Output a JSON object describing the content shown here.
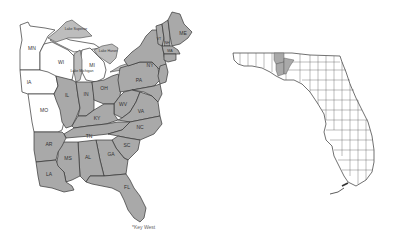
{
  "figure": {
    "type": "species distribution map",
    "shade_color": "#a9a9a9",
    "unshaded_color": "#ffffff",
    "outline_color": "#333333"
  },
  "us_map": {
    "states_present": [
      "ME",
      "NH",
      "VT",
      "MA",
      "RI",
      "CT",
      "NY",
      "NJ",
      "PA",
      "DE",
      "MD",
      "VA",
      "WV",
      "OH",
      "IN",
      "IL",
      "KY",
      "TN",
      "NC",
      "SC",
      "GA",
      "AL",
      "MS",
      "LA",
      "AR",
      "FL"
    ],
    "states_absent": [
      "MN",
      "WI",
      "MI",
      "IA",
      "MO"
    ],
    "labels": {
      "mn": "MN",
      "wi": "WI",
      "mi": "MI",
      "ia": "IA",
      "mo": "MO",
      "il": "IL",
      "in": "IN",
      "oh": "OH",
      "ky": "KY",
      "wv": "WV",
      "pa": "PA",
      "ny": "NY",
      "va": "VA",
      "nc": "NC",
      "tn": "TN",
      "sc": "SC",
      "ga": "GA",
      "al": "AL",
      "ms": "MS",
      "ar": "AR",
      "la": "LA",
      "fl": "FL",
      "me": "ME",
      "vt": "VT",
      "nh": "NH",
      "ma": "MA"
    },
    "lakes": {
      "superior": "Lake Superior",
      "michigan": "Lake Michigan",
      "huron": "Lake Huron",
      "erie": "Lake Erie"
    },
    "annotation": "*Key West"
  },
  "florida_map": {
    "title": "Florida counties",
    "counties_present_count": 3,
    "region_present": "Panhandle (central)"
  }
}
